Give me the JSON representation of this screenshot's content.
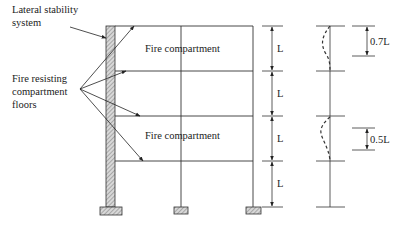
{
  "labels": {
    "lateral_line1": "Lateral stability",
    "lateral_line2": "system",
    "fire_line1": "Fire resisting",
    "fire_line2": "compartment",
    "fire_line3": "floors",
    "compartment_top": "Fire compartment",
    "compartment_mid": "Fire compartment"
  },
  "dimensions": {
    "storey_labels": [
      "L",
      "L",
      "L",
      "L"
    ],
    "effective_length_top": "0.7L",
    "effective_length_mid": "0.5L"
  },
  "colors": {
    "line": "#333333",
    "hatch": "#888888"
  }
}
